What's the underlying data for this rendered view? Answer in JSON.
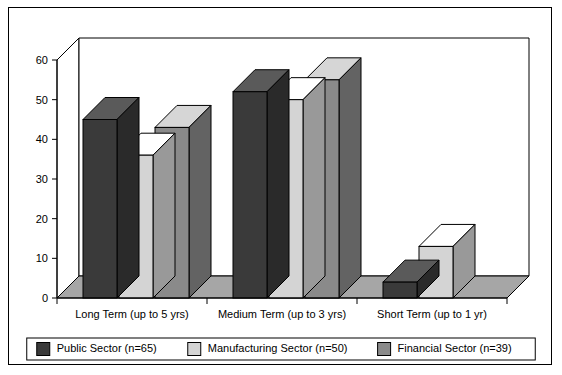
{
  "chart_data": {
    "type": "bar",
    "title": "",
    "subtitle": "",
    "xlabel": "",
    "ylabel": "",
    "categories": [
      "Long Term (up to 5 yrs)",
      "Medium Term (up to 3 yrs)",
      "Short Term (up to 1 yr)"
    ],
    "series": [
      {
        "name": "Public Sector (n=65)",
        "values": [
          45,
          52,
          4
        ],
        "color": "#3a3a3a"
      },
      {
        "name": "Manufacturing Sector (n=50)",
        "values": [
          36,
          50,
          13
        ],
        "color": "#d4d4d4"
      },
      {
        "name": "Financial Sector (n=39)",
        "values": [
          43,
          55,
          0
        ],
        "color": "#8a8a8a"
      }
    ],
    "ylim": [
      0,
      60
    ],
    "yticks": [
      0,
      10,
      20,
      30,
      40,
      50,
      60
    ],
    "ytick_labels": [
      "0",
      "10",
      "20",
      "30",
      "40",
      "50",
      "60"
    ],
    "grid": false,
    "legend_position": "bottom",
    "three_d": true,
    "style": {
      "background": "#ffffff",
      "border_color": "#000000",
      "axis_color": "#000000",
      "text_color": "#000000",
      "floor_color": "#a6a6a6",
      "wall_color": "#ffffff"
    }
  },
  "legend": {
    "items": [
      {
        "label": "Public Sector (n=65)",
        "swatch": "#3a3a3a"
      },
      {
        "label": "Manufacturing Sector (n=50)",
        "swatch": "#d4d4d4"
      },
      {
        "label": "Financial Sector (n=39)",
        "swatch": "#8a8a8a"
      }
    ]
  }
}
